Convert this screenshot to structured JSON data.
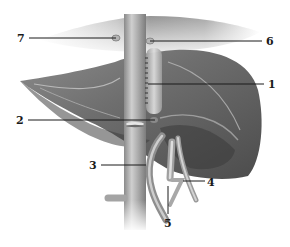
{
  "figure": {
    "colors": {
      "liver_dark": "#4a4a4a",
      "liver_mid": "#7a7a7a",
      "liver_light": "#a8a8a8",
      "vessel": "#9a9a9a",
      "vessel_highlight": "#d8d8d8",
      "leader_line": "#1a1a1a",
      "background": "#ffffff"
    }
  },
  "labels": [
    {
      "id": "1",
      "text": "1",
      "x": 268,
      "y": 79,
      "line": [
        148,
        84,
        264,
        84
      ]
    },
    {
      "id": "2",
      "text": "2",
      "x": 16,
      "y": 115,
      "line": [
        28,
        120,
        155,
        120
      ]
    },
    {
      "id": "3",
      "text": "3",
      "x": 89,
      "y": 160,
      "line": [
        101,
        165,
        146,
        165
      ]
    },
    {
      "id": "4",
      "text": "4",
      "x": 207,
      "y": 177,
      "line": [
        183,
        181,
        205,
        181
      ]
    },
    {
      "id": "5",
      "text": "5",
      "x": 164,
      "y": 218,
      "line": [
        168,
        186,
        168,
        214
      ]
    },
    {
      "id": "6",
      "text": "6",
      "x": 266,
      "y": 36,
      "line": [
        150,
        41,
        262,
        41
      ]
    },
    {
      "id": "7",
      "text": "7",
      "x": 17,
      "y": 33,
      "line": [
        29,
        38,
        116,
        38
      ]
    }
  ]
}
